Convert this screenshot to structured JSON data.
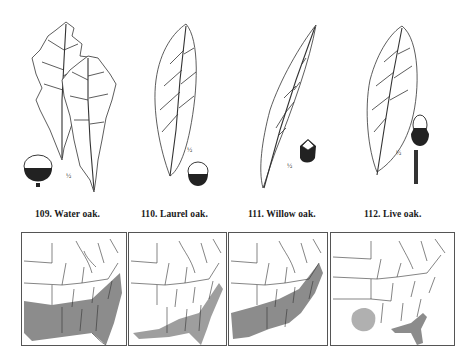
{
  "plate": {
    "figures": [
      {
        "number": "109.",
        "name": "Water oak.",
        "caption": "109.  Water oak.",
        "scale_mark": "½"
      },
      {
        "number": "110.",
        "name": "Laurel oak.",
        "caption": "110.  Laurel oak.",
        "scale_mark": "½"
      },
      {
        "number": "111.",
        "name": "Willow oak.",
        "caption": "111.  Willow oak.",
        "scale_mark": "½"
      },
      {
        "number": "112.",
        "name": "Live oak.",
        "caption": "112.  Live oak.",
        "scale_mark": "½"
      }
    ],
    "maps": [
      {
        "species": "Water oak",
        "range": "Southeastern coastal plain and Gulf states"
      },
      {
        "species": "Laurel oak",
        "range": "Atlantic and Gulf coastal plain"
      },
      {
        "species": "Willow oak",
        "range": "Mississippi valley to mid-Atlantic"
      },
      {
        "species": "Live oak",
        "range": "Gulf coast, Florida, and central Texas"
      }
    ],
    "colors": {
      "ink": "#1a1a1a",
      "range_fill": "#8c8c8c",
      "range_light": "#b5b5b5",
      "paper": "#ffffff"
    }
  }
}
